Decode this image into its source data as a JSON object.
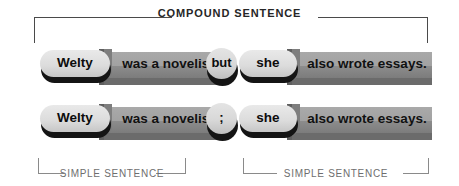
{
  "diagram": {
    "type": "sentence-structure-diagram",
    "top_bracket_label": "COMPOUND SENTENCE",
    "rows": [
      {
        "id": "row-conjunction",
        "segments": [
          {
            "kind": "pill",
            "text": "Welty"
          },
          {
            "kind": "bar",
            "text": "was a novelist"
          },
          {
            "kind": "circle",
            "text": "but"
          },
          {
            "kind": "pill",
            "text": "she"
          },
          {
            "kind": "bar",
            "text": "also wrote essays."
          }
        ]
      },
      {
        "id": "row-semicolon",
        "segments": [
          {
            "kind": "pill",
            "text": "Welty"
          },
          {
            "kind": "bar",
            "text": "was a novelist"
          },
          {
            "kind": "circle",
            "text": ";"
          },
          {
            "kind": "pill",
            "text": "she"
          },
          {
            "kind": "bar",
            "text": "also wrote essays."
          }
        ]
      }
    ],
    "bottom_brackets": [
      {
        "id": "bracket-left",
        "label": "SIMPLE SENTENCE"
      },
      {
        "id": "bracket-right",
        "label": "SIMPLE SENTENCE"
      }
    ],
    "colors": {
      "background": "#ffffff",
      "bar_light": "#a9a9a9",
      "bar_dark": "#7c7c7c",
      "pill_light": "#e9e9e9",
      "pill_dark": "#c6c6c6",
      "shadow": "#141414",
      "text_dark": "#111111",
      "bracket_top": "#4a4a4a",
      "bracket_bottom": "#8a8a8a",
      "label_gray": "#6e6e6e"
    }
  }
}
